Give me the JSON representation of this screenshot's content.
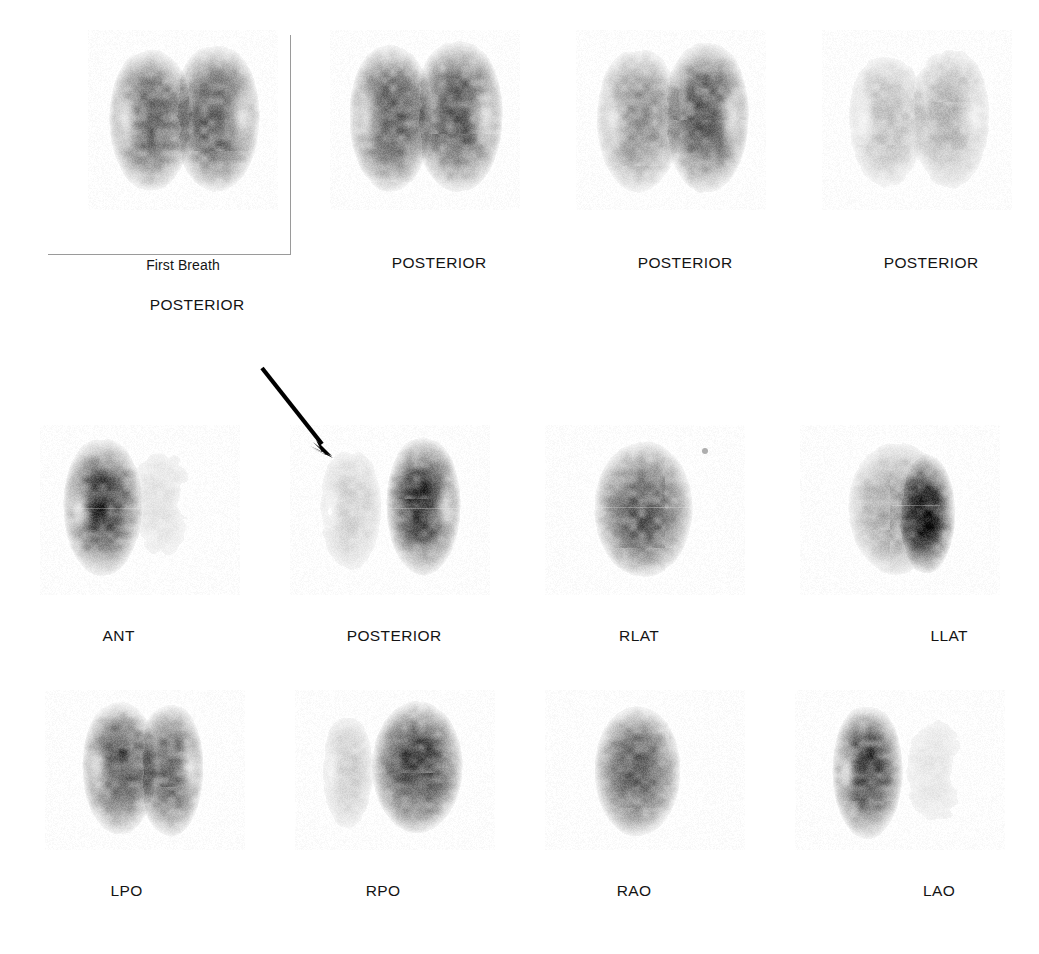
{
  "figure": {
    "background_color": "#ffffff",
    "ink_color": "#141414",
    "frame_color": "#9a9a9a",
    "arrow_color": "#000000"
  },
  "annotations": {
    "arrow": {
      "name": "pointer-arrow",
      "direction": "down-right",
      "start": [
        262,
        368
      ],
      "end": [
        330,
        455
      ],
      "points_at": "left lung of perfusion POSTERIOR view (row 2, panel 2)"
    }
  },
  "rows": [
    {
      "name": "ventilation-row",
      "panels": [
        {
          "id": "v-first-breath-posterior",
          "caption_top": "First Breath",
          "caption": "POSTERIOR",
          "framed": true,
          "left_lung_intensity": 0.88,
          "right_lung_intensity": 0.9,
          "view": "posterior"
        },
        {
          "id": "v-posterior-2",
          "caption_top": "",
          "caption": "POSTERIOR",
          "framed": false,
          "left_lung_intensity": 0.92,
          "right_lung_intensity": 0.95,
          "view": "posterior"
        },
        {
          "id": "v-posterior-3",
          "caption_top": "",
          "caption": "POSTERIOR",
          "framed": false,
          "left_lung_intensity": 0.62,
          "right_lung_intensity": 0.93,
          "view": "posterior"
        },
        {
          "id": "v-posterior-4",
          "caption_top": "",
          "caption": "POSTERIOR",
          "framed": false,
          "left_lung_intensity": 0.33,
          "right_lung_intensity": 0.38,
          "view": "posterior"
        }
      ]
    },
    {
      "name": "perfusion-row-1",
      "panels": [
        {
          "id": "p-ant",
          "caption": "ANT",
          "left_lung_intensity": 0.95,
          "right_lung_intensity": 0.14,
          "view": "anterior"
        },
        {
          "id": "p-posterior",
          "caption": "POSTERIOR",
          "left_lung_intensity": 0.24,
          "right_lung_intensity": 0.97,
          "view": "posterior"
        },
        {
          "id": "p-rlat",
          "caption": "RLAT",
          "single_lung_intensity": 0.82,
          "view": "right-lateral"
        },
        {
          "id": "p-llat",
          "caption": "LLAT",
          "single_lung_intensity": 0.9,
          "view": "left-lateral"
        }
      ]
    },
    {
      "name": "perfusion-row-2",
      "panels": [
        {
          "id": "p-lpo",
          "caption": "LPO",
          "left_lung_intensity": 0.9,
          "right_lung_intensity": 0.86,
          "view": "left-posterior-oblique"
        },
        {
          "id": "p-rpo",
          "caption": "RPO",
          "left_lung_intensity": 0.26,
          "right_lung_intensity": 0.98,
          "view": "right-posterior-oblique"
        },
        {
          "id": "p-rao",
          "caption": "RAO",
          "single_lung_intensity": 0.8,
          "view": "right-anterior-oblique"
        },
        {
          "id": "p-lao",
          "caption": "LAO",
          "left_lung_intensity": 0.96,
          "right_lung_intensity": 0.12,
          "view": "left-anterior-oblique"
        }
      ]
    }
  ]
}
